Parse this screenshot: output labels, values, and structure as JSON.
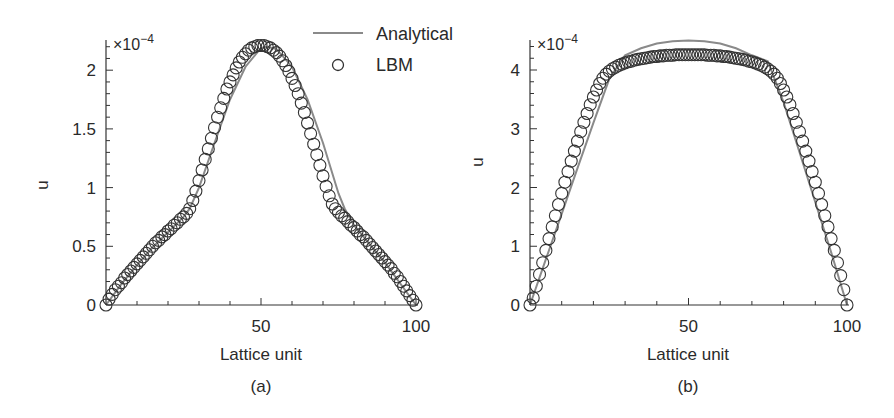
{
  "figure": {
    "panels": [
      {
        "id": "a",
        "label": "(a)"
      },
      {
        "id": "b",
        "label": "(b)"
      }
    ],
    "legend": {
      "items": [
        {
          "label": "Analytical",
          "marker": "line",
          "color": "#8a8a8a"
        },
        {
          "label": "LBM",
          "marker": "open-circle",
          "color": "#333333"
        }
      ]
    },
    "colors": {
      "axis": "#333333",
      "analytical": "#8a8a8a",
      "lbm": "#333333",
      "background": "#ffffff"
    }
  },
  "chart_data": [
    {
      "type": "line",
      "panel": "(a)",
      "title": "",
      "xlabel": "Lattice unit",
      "ylabel": "u",
      "y_multiplier_label": "×10−4",
      "y_multiplier_base": "×10",
      "y_multiplier_exp": "−4",
      "xlim": [
        0,
        100
      ],
      "ylim": [
        0,
        2.25
      ],
      "xticks": [
        50,
        100
      ],
      "xtick_labels": [
        "50",
        "100"
      ],
      "yticks": [
        0,
        0.5,
        1,
        1.5,
        2
      ],
      "ytick_labels": [
        "0",
        "0.5",
        "1",
        "1.5",
        "2"
      ],
      "grid": false,
      "legend_position": "top-right (shared, between panels)",
      "series": [
        {
          "name": "Analytical",
          "style": "line",
          "x": [
            0,
            5,
            10,
            15,
            20,
            25,
            27,
            30,
            35,
            40,
            45,
            50,
            52,
            55,
            60,
            65,
            70,
            75,
            77,
            80,
            85,
            90,
            95,
            100
          ],
          "values": [
            0,
            0.18,
            0.34,
            0.49,
            0.62,
            0.75,
            0.82,
            1.0,
            1.38,
            1.75,
            2.03,
            2.19,
            2.2,
            2.18,
            2.03,
            1.75,
            1.38,
            0.95,
            0.82,
            0.68,
            0.52,
            0.36,
            0.18,
            0
          ]
        },
        {
          "name": "LBM",
          "style": "open-circle",
          "x": [
            0,
            1,
            2,
            3,
            4,
            5,
            6,
            7,
            8,
            9,
            10,
            11,
            12,
            13,
            14,
            15,
            16,
            17,
            18,
            19,
            20,
            21,
            22,
            23,
            24,
            25,
            26,
            27,
            28,
            29,
            30,
            31,
            32,
            33,
            34,
            35,
            36,
            37,
            38,
            39,
            40,
            41,
            42,
            43,
            44,
            45,
            46,
            47,
            48,
            49,
            50,
            51,
            52,
            53,
            54,
            55,
            56,
            57,
            58,
            59,
            60,
            61,
            62,
            63,
            64,
            65,
            66,
            67,
            68,
            69,
            70,
            71,
            72,
            73,
            74,
            75,
            76,
            77,
            78,
            79,
            80,
            81,
            82,
            83,
            84,
            85,
            86,
            87,
            88,
            89,
            90,
            91,
            92,
            93,
            94,
            95,
            96,
            97,
            98,
            99,
            100
          ],
          "values": [
            0,
            0.05,
            0.09,
            0.13,
            0.16,
            0.19,
            0.23,
            0.26,
            0.29,
            0.32,
            0.35,
            0.38,
            0.41,
            0.44,
            0.47,
            0.5,
            0.53,
            0.55,
            0.58,
            0.6,
            0.63,
            0.65,
            0.68,
            0.7,
            0.73,
            0.75,
            0.78,
            0.82,
            0.89,
            0.97,
            1.06,
            1.15,
            1.24,
            1.33,
            1.42,
            1.51,
            1.6,
            1.68,
            1.76,
            1.84,
            1.9,
            1.96,
            2.02,
            2.07,
            2.11,
            2.14,
            2.17,
            2.19,
            2.2,
            2.21,
            2.21,
            2.21,
            2.2,
            2.19,
            2.17,
            2.15,
            2.12,
            2.08,
            2.04,
            1.99,
            1.93,
            1.87,
            1.8,
            1.72,
            1.64,
            1.55,
            1.46,
            1.37,
            1.28,
            1.19,
            1.1,
            1.01,
            0.93,
            0.86,
            0.82,
            0.79,
            0.76,
            0.74,
            0.71,
            0.68,
            0.66,
            0.63,
            0.6,
            0.58,
            0.55,
            0.52,
            0.49,
            0.46,
            0.43,
            0.4,
            0.37,
            0.34,
            0.31,
            0.27,
            0.24,
            0.2,
            0.16,
            0.12,
            0.08,
            0.04,
            0
          ]
        }
      ]
    },
    {
      "type": "line",
      "panel": "(b)",
      "title": "",
      "xlabel": "Lattice unit",
      "ylabel": "u",
      "y_multiplier_label": "×10−4",
      "y_multiplier_base": "×10",
      "y_multiplier_exp": "−4",
      "xlim": [
        0,
        100
      ],
      "ylim": [
        0,
        4.5
      ],
      "xticks": [
        50,
        100
      ],
      "xtick_labels": [
        "50",
        "100"
      ],
      "yticks": [
        0,
        1,
        2,
        3,
        4
      ],
      "ytick_labels": [
        "0",
        "1",
        "2",
        "3",
        "4"
      ],
      "grid": false,
      "legend_position": "top-right (shared, between panels)",
      "series": [
        {
          "name": "Analytical",
          "style": "line",
          "x": [
            0,
            5,
            10,
            15,
            20,
            25,
            30,
            35,
            40,
            45,
            50,
            55,
            60,
            65,
            70,
            75,
            80,
            85,
            90,
            95,
            100
          ],
          "values": [
            0,
            0.78,
            1.55,
            2.33,
            3.1,
            3.85,
            4.25,
            4.37,
            4.45,
            4.49,
            4.5,
            4.49,
            4.45,
            4.37,
            4.25,
            4.15,
            3.45,
            2.6,
            1.75,
            0.9,
            0
          ]
        },
        {
          "name": "LBM",
          "style": "open-circle",
          "x": [
            0,
            1,
            2,
            3,
            4,
            5,
            6,
            7,
            8,
            9,
            10,
            11,
            12,
            13,
            14,
            15,
            16,
            17,
            18,
            19,
            20,
            21,
            22,
            23,
            24,
            25,
            26,
            27,
            28,
            29,
            30,
            31,
            32,
            33,
            34,
            35,
            36,
            37,
            38,
            39,
            40,
            41,
            42,
            43,
            44,
            45,
            46,
            47,
            48,
            49,
            50,
            51,
            52,
            53,
            54,
            55,
            56,
            57,
            58,
            59,
            60,
            61,
            62,
            63,
            64,
            65,
            66,
            67,
            68,
            69,
            70,
            71,
            72,
            73,
            74,
            75,
            76,
            77,
            78,
            79,
            80,
            81,
            82,
            83,
            84,
            85,
            86,
            87,
            88,
            89,
            90,
            91,
            92,
            93,
            94,
            95,
            96,
            97,
            98,
            99,
            100
          ],
          "values": [
            0,
            0.12,
            0.32,
            0.52,
            0.72,
            0.93,
            1.13,
            1.33,
            1.52,
            1.71,
            1.9,
            2.09,
            2.27,
            2.45,
            2.62,
            2.79,
            2.95,
            3.11,
            3.26,
            3.41,
            3.54,
            3.66,
            3.77,
            3.86,
            3.93,
            3.98,
            4.02,
            4.05,
            4.08,
            4.1,
            4.12,
            4.14,
            4.15,
            4.17,
            4.18,
            4.19,
            4.2,
            4.21,
            4.22,
            4.23,
            4.23,
            4.24,
            4.24,
            4.25,
            4.25,
            4.25,
            4.26,
            4.26,
            4.26,
            4.26,
            4.26,
            4.26,
            4.26,
            4.26,
            4.26,
            4.26,
            4.25,
            4.25,
            4.25,
            4.24,
            4.24,
            4.23,
            4.23,
            4.22,
            4.21,
            4.2,
            4.19,
            4.18,
            4.17,
            4.15,
            4.14,
            4.12,
            4.1,
            4.08,
            4.05,
            4.02,
            3.98,
            3.93,
            3.86,
            3.77,
            3.66,
            3.54,
            3.41,
            3.26,
            3.11,
            2.95,
            2.79,
            2.62,
            2.45,
            2.27,
            2.09,
            1.9,
            1.71,
            1.52,
            1.33,
            1.13,
            0.93,
            0.72,
            0.5,
            0.26,
            0
          ]
        }
      ]
    }
  ]
}
